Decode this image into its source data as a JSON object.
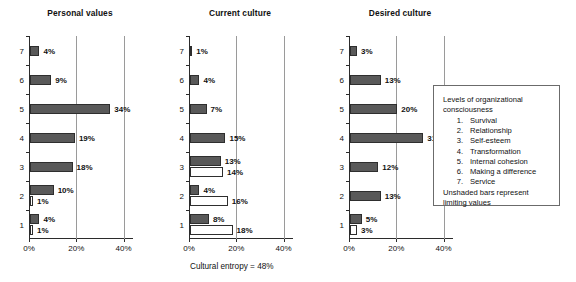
{
  "chart_data": [
    {
      "type": "bar",
      "title": "Personal values",
      "orientation": "horizontal",
      "xlabel": "",
      "ylabel": "",
      "xlim": [
        0,
        44
      ],
      "xticks": [
        0,
        20,
        40
      ],
      "xticklabels": [
        "0%",
        "20%",
        "40%"
      ],
      "categories": [
        "1",
        "2",
        "3",
        "4",
        "5",
        "6",
        "7"
      ],
      "grid": "vertical",
      "series": [
        {
          "name": "values",
          "style": "shaded",
          "values": [
            4,
            10,
            18,
            19,
            34,
            9,
            4
          ],
          "labels": [
            "4%",
            "10%",
            "18%",
            "19%",
            "34%",
            "9%",
            "4%"
          ]
        },
        {
          "name": "limiting values",
          "style": "unshaded",
          "values": [
            1,
            1,
            null,
            null,
            null,
            null,
            null
          ],
          "labels": [
            "1%",
            "1%",
            null,
            null,
            null,
            null,
            null
          ]
        }
      ]
    },
    {
      "type": "bar",
      "title": "Current culture",
      "orientation": "horizontal",
      "xlabel": "",
      "ylabel": "",
      "xlim": [
        0,
        44
      ],
      "xticks": [
        0,
        20,
        40
      ],
      "xticklabels": [
        "0%",
        "20%",
        "40%"
      ],
      "categories": [
        "1",
        "2",
        "3",
        "4",
        "5",
        "6",
        "7"
      ],
      "grid": "vertical",
      "annotation": "Cultural entropy = 48%",
      "series": [
        {
          "name": "values",
          "style": "shaded",
          "values": [
            8,
            4,
            13,
            15,
            7,
            4,
            1
          ],
          "labels": [
            "8%",
            "4%",
            "13%",
            "15%",
            "7%",
            "4%",
            "1%"
          ]
        },
        {
          "name": "limiting values",
          "style": "unshaded",
          "values": [
            18,
            16,
            14,
            null,
            null,
            null,
            null
          ],
          "labels": [
            "18%",
            "16%",
            "14%",
            null,
            null,
            null,
            null
          ]
        }
      ]
    },
    {
      "type": "bar",
      "title": "Desired culture",
      "orientation": "horizontal",
      "xlabel": "",
      "ylabel": "",
      "xlim": [
        0,
        44
      ],
      "xticks": [
        0,
        20,
        40
      ],
      "xticklabels": [
        "0%",
        "20%",
        "40%"
      ],
      "categories": [
        "1",
        "2",
        "3",
        "4",
        "5",
        "6",
        "7"
      ],
      "grid": "vertical",
      "series": [
        {
          "name": "values",
          "style": "shaded",
          "values": [
            5,
            13,
            12,
            31,
            20,
            13,
            3
          ],
          "labels": [
            "5%",
            "13%",
            "12%",
            "31%",
            "20%",
            "13%",
            "3%"
          ]
        },
        {
          "name": "limiting values",
          "style": "unshaded",
          "values": [
            3,
            null,
            null,
            null,
            null,
            null,
            null
          ],
          "labels": [
            "3%",
            null,
            null,
            null,
            null,
            null,
            null
          ]
        }
      ]
    }
  ],
  "legend": {
    "heading_line1": "Levels of organizational",
    "heading_line2": "consciousness",
    "items": [
      {
        "num": "1.",
        "label": "Survival"
      },
      {
        "num": "2.",
        "label": "Relationship"
      },
      {
        "num": "3.",
        "label": "Self-esteem"
      },
      {
        "num": "4.",
        "label": "Transformation"
      },
      {
        "num": "5.",
        "label": "Internal cohesion"
      },
      {
        "num": "6.",
        "label": "Making a difference"
      },
      {
        "num": "7.",
        "label": "Service"
      }
    ],
    "footer_line1": "Unshaded bars represent",
    "footer_line2": "limiting values"
  },
  "colors": {
    "shaded_fill": "#595959",
    "bar_stroke": "#2e2e2e",
    "unshaded_fill": "#ffffff",
    "gridline": "#9a9a9a",
    "axis": "#2b2b2b",
    "text": "#111111"
  }
}
